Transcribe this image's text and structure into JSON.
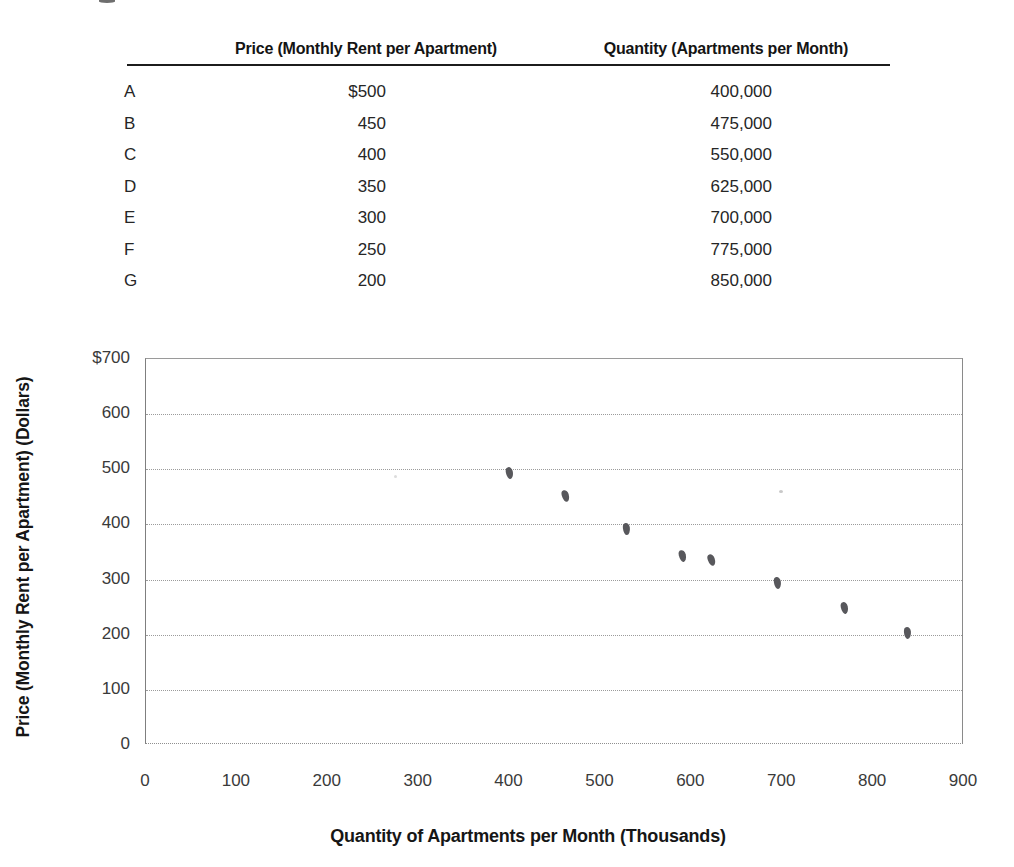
{
  "table": {
    "columns": {
      "price_header": "Price (Monthly Rent per Apartment)",
      "quantity_header": "Quantity (Apartments per Month)"
    },
    "rows": [
      {
        "label": "A",
        "price": "$500",
        "quantity": "400,000"
      },
      {
        "label": "B",
        "price": "450",
        "quantity": "475,000"
      },
      {
        "label": "C",
        "price": "400",
        "quantity": "550,000"
      },
      {
        "label": "D",
        "price": "350",
        "quantity": "625,000"
      },
      {
        "label": "E",
        "price": "300",
        "quantity": "700,000"
      },
      {
        "label": "F",
        "price": "250",
        "quantity": "775,000"
      },
      {
        "label": "G",
        "price": "200",
        "quantity": "850,000"
      }
    ]
  },
  "chart_data": {
    "type": "scatter",
    "title": "",
    "xlabel": "Quantity of Apartments per Month (Thousands)",
    "ylabel": "Price (Monthly Rent per Apartment) (Dollars)",
    "xlim": [
      0,
      900
    ],
    "ylim": [
      0,
      700
    ],
    "x_ticks": [
      "0",
      "100",
      "200",
      "300",
      "400",
      "500",
      "600",
      "700",
      "800",
      "900"
    ],
    "y_ticks": [
      "$700",
      "600",
      "500",
      "400",
      "300",
      "200",
      "100",
      "0"
    ],
    "y_tick_values": [
      700,
      600,
      500,
      400,
      300,
      200,
      100,
      0
    ],
    "grid": "horizontal-dotted",
    "legend": "none",
    "marker_color": "#58585c",
    "points": [
      {
        "x": 400,
        "y": 494
      },
      {
        "x": 462,
        "y": 452
      },
      {
        "x": 529,
        "y": 391
      },
      {
        "x": 590,
        "y": 343
      },
      {
        "x": 622,
        "y": 335
      },
      {
        "x": 695,
        "y": 293
      },
      {
        "x": 768,
        "y": 249
      },
      {
        "x": 838,
        "y": 204
      }
    ]
  }
}
